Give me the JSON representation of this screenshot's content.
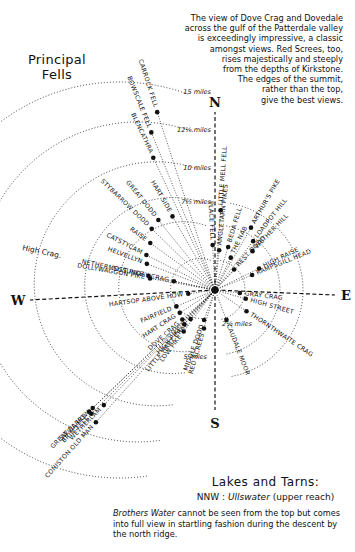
{
  "title": {
    "line1": "Principal",
    "line2": "Fells"
  },
  "note": {
    "lines": [
      "The view of Dove Crag and Dovedale",
      "across the gulf of the Patterdale valley",
      "is exceedingly impressive, a classic",
      "amongst views.  Red Screes, too,",
      "rises majestically and steeply",
      "from the depths of Kirkstone.",
      "The edges of the summit,",
      "rather than the top,",
      "give the best views."
    ]
  },
  "compass": {
    "n": "N",
    "s": "S",
    "e": "E",
    "w": "W"
  },
  "rings": [
    {
      "label": "2½ miles",
      "r": 30
    },
    {
      "label": "5 miles",
      "r": 65
    },
    {
      "label": "7½ miles",
      "r": 88
    },
    {
      "label": "10 miles",
      "r": 122
    },
    {
      "label": "12½ miles",
      "r": 160
    },
    {
      "label": "15 miles",
      "r": 198
    }
  ],
  "fells": [
    {
      "name": "CARROCK FELL",
      "angle": -18,
      "dist": 187
    },
    {
      "name": "BOWSCALE FELL",
      "angle": -22,
      "dist": 170
    },
    {
      "name": "BLENCATHRA",
      "angle": -25,
      "dist": 146
    },
    {
      "name": "LITTLE MELL FELL",
      "angle": 4,
      "dist": 80
    },
    {
      "name": "PLACE FELL",
      "angle": -3,
      "dist": 45
    },
    {
      "name": "ANGLETARN PIKES",
      "angle": 6,
      "dist": 40
    },
    {
      "name": "BEDA FELL",
      "angle": 17,
      "dist": 45
    },
    {
      "name": "ARTHUR'S PIKE",
      "angle": 30,
      "dist": 72
    },
    {
      "name": "THE NAB",
      "angle": 26,
      "dist": 36
    },
    {
      "name": "LOADPOT HILL",
      "angle": 38,
      "dist": 62
    },
    {
      "name": "WETHER HILL",
      "angle": 44,
      "dist": 54
    },
    {
      "name": "REST DODD",
      "angle": 43,
      "dist": 28
    },
    {
      "name": "HIGH RAISE",
      "angle": 64,
      "dist": 49
    },
    {
      "name": "RAMPSGILL HEAD",
      "angle": 68,
      "dist": 40
    },
    {
      "name": "GRAY CRAG",
      "angle": 97,
      "dist": 25
    },
    {
      "name": "HIGH STREET",
      "angle": 106,
      "dist": 32
    },
    {
      "name": "THORNTHWAITE CRAG",
      "angle": 124,
      "dist": 38
    },
    {
      "name": "CAUDALE MOOR",
      "angle": 159,
      "dist": 32
    },
    {
      "name": "RED SCREES",
      "angle": 196,
      "dist": 40
    },
    {
      "name": "MIDDLE DODD",
      "angle": 200,
      "dist": 32
    },
    {
      "name": "LOW PIKE",
      "angle": 217,
      "dist": 52
    },
    {
      "name": "HIGH PIKE",
      "angle": 222,
      "dist": 46
    },
    {
      "name": "LITTLE HART CRAG",
      "angle": 220,
      "dist": 38
    },
    {
      "name": "DOVE CRAG",
      "angle": 228,
      "dist": 44
    },
    {
      "name": "HART CRAG",
      "angle": 237,
      "dist": 42
    },
    {
      "name": "FAIRFIELD",
      "angle": 247,
      "dist": 42
    },
    {
      "name": "HARTSOP ABOVE HOW",
      "angle": 262,
      "dist": 27
    },
    {
      "name": "DOLLYWAGGON PIKE",
      "angle": 280,
      "dist": 66
    },
    {
      "name": "NETHERMOST PIKE",
      "angle": 282,
      "dist": 68
    },
    {
      "name": "St SUNDAY CRAG",
      "angle": 282,
      "dist": 42
    },
    {
      "name": "HELVELLYN",
      "angle": 291,
      "dist": 73
    },
    {
      "name": "CATSTYCAM",
      "angle": 297,
      "dist": 77
    },
    {
      "name": "RAISE",
      "angle": 306,
      "dist": 80
    },
    {
      "name": "STYBARROW DODD",
      "angle": 314,
      "dist": 88
    },
    {
      "name": "GREAT DODD",
      "angle": 321,
      "dist": 90
    },
    {
      "name": "HART SIDE",
      "angle": 330,
      "dist": 85
    },
    {
      "name": "GREAT CARRS",
      "angle": 226,
      "dist": 175
    },
    {
      "name": "SWIRL HOW",
      "angle": 226,
      "dist": 170
    },
    {
      "name": "WETHERLAM",
      "angle": 224,
      "dist": 160
    },
    {
      "name": "BRIM FELL",
      "angle": 225,
      "dist": 175
    },
    {
      "name": "CONISTON OLD MAN",
      "angle": 222,
      "dist": 178
    }
  ],
  "other_labels": {
    "high_crag": "High Crag."
  },
  "lakes": {
    "title": "Lakes and Tarns:",
    "direction": "NNW :",
    "lake": "Ullswater",
    "lake_note": "(upper reach)",
    "body_lake": "Brothers Water",
    "body_rest": " cannot be seen from the top but comes into full view in startling fashion during the descent by the north ridge."
  }
}
